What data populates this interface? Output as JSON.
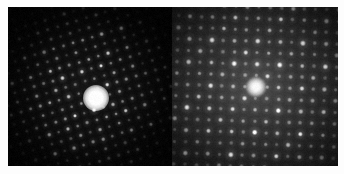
{
  "figure": {
    "background_color": "#ffffff",
    "width": 344,
    "height": 174,
    "panel_count": 2
  },
  "panels": [
    {
      "id": "left",
      "name": "left-diffraction-pattern",
      "description": "Dark-field electron diffraction pattern with oblique rhombic spot lattice fading radially outward",
      "background_color": "#070707",
      "spot_color": "#ffffff",
      "lattice_type": "oblique",
      "bounds": {
        "x": 8,
        "y": 7,
        "width": 164,
        "height": 159
      },
      "center_beam": {
        "x": 88,
        "y": 91,
        "radius": 13,
        "color": "#ffffff"
      },
      "lattice": {
        "a_vector": [
          9.6,
          -3.0
        ],
        "b_vector": [
          3.0,
          9.6
        ],
        "index_range": 13,
        "base_spot_radius": 1.9,
        "falloff_radius": 84
      }
    },
    {
      "id": "right",
      "name": "right-diffraction-pattern",
      "description": "Brighter electron diffraction pattern with square lattice of alternating large and small spots",
      "background_color": "#1c1c1c",
      "spot_color": "#f2f2f2",
      "lattice_type": "square",
      "bounds": {
        "x": 172,
        "y": 7,
        "width": 166,
        "height": 159
      },
      "center_beam": {
        "x": 256,
        "y": 87,
        "radius": 10,
        "color": "#ffffff"
      },
      "lattice": {
        "a_vector": [
          11.4,
          0.4
        ],
        "b_vector": [
          -0.4,
          11.4
        ],
        "index_range": 11,
        "base_spot_radius": 2.3,
        "falloff_radius": 108
      }
    }
  ],
  "chart_data": {
    "type": "scatter",
    "xlabel": "",
    "ylabel": "",
    "subplots": [
      {
        "name": "left-diffraction-pattern",
        "lattice": "oblique",
        "spot_count_approx": 430,
        "center_spot_intensity": 1.0,
        "background_intensity": 0.03,
        "notes": "Spots arranged on an oblique lattice, intensity decays with radius; strong direct beam at center."
      },
      {
        "name": "right-diffraction-pattern",
        "lattice": "square",
        "spot_count_approx": 330,
        "center_spot_intensity": 1.0,
        "background_intensity": 0.18,
        "notes": "Square lattice with alternating strong and weak reflections; diffuse bright halo around center."
      }
    ]
  }
}
